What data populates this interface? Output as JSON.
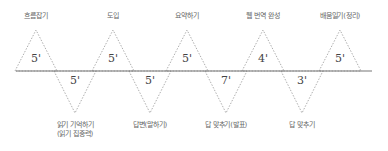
{
  "diagram": {
    "type": "timeline-zigzag",
    "line_color": "#777777",
    "triangle_stroke": "#999999",
    "top_steps": [
      {
        "label": "흐름잡기",
        "duration": "5'",
        "x": 36
      },
      {
        "label": "도입",
        "duration": "5'",
        "x": 113
      },
      {
        "label": "요약하기",
        "duration": "5'",
        "x": 187
      },
      {
        "label": "웹 번역 완성",
        "duration": "4'",
        "x": 263
      },
      {
        "label": "배움일기(정리)",
        "duration": "5'",
        "x": 340
      }
    ],
    "bottom_steps": [
      {
        "label": "읽기 기억하기",
        "label2": "(읽기 집중력)",
        "duration": "5'",
        "x": 75
      },
      {
        "label": "답변(말하기)",
        "label2": "",
        "duration": "5'",
        "x": 150
      },
      {
        "label": "답 맞추기(발표)",
        "label2": "",
        "duration": "7'",
        "x": 226
      },
      {
        "label": "답 맞추기",
        "label2": "",
        "duration": "3'",
        "x": 302
      }
    ]
  }
}
